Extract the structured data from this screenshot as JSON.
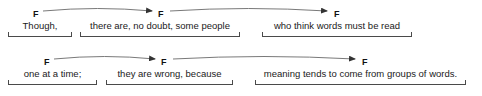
{
  "diagram": {
    "type": "intonation-phrase-annotation",
    "sentence": "Though, there are, no doubt, some people who think words must be read one at a time; they are wrong, because meaning tends to come from groups of words.",
    "tone_mark": "F",
    "rows": [
      {
        "row_index": 0,
        "units": [
          {
            "text": "Though,",
            "tone": "F",
            "tone_x": 33,
            "tone_y": 10,
            "bracket_left": 8,
            "bracket_right": 72,
            "has_incoming_arrow": false
          },
          {
            "text": "there are, no doubt, some people",
            "tone": "F",
            "tone_x": 158,
            "tone_y": 10,
            "bracket_left": 80,
            "bracket_right": 240,
            "has_incoming_arrow": true
          },
          {
            "text": "who think words must be read",
            "tone": "F",
            "tone_x": 334,
            "tone_y": 10,
            "bracket_left": 262,
            "bracket_right": 412,
            "has_incoming_arrow": true
          }
        ],
        "arcs": [
          {
            "from_x": 43,
            "to_x": 152,
            "y": 11,
            "sag": 5
          },
          {
            "from_x": 170,
            "to_x": 327,
            "y": 11,
            "sag": 5
          }
        ]
      },
      {
        "row_index": 1,
        "units": [
          {
            "text": "one at a time;",
            "tone": "F",
            "tone_x": 44,
            "tone_y": 58,
            "bracket_left": 8,
            "bracket_right": 97,
            "has_incoming_arrow": false
          },
          {
            "text": "they are wrong, because",
            "tone": "F",
            "tone_x": 161,
            "tone_y": 58,
            "bracket_left": 106,
            "bracket_right": 233,
            "has_incoming_arrow": true
          },
          {
            "text": "meaning tends to come from groups of words.",
            "tone": "F",
            "tone_x": 362,
            "tone_y": 58,
            "bracket_left": 255,
            "bracket_right": 466,
            "has_incoming_arrow": true
          }
        ],
        "arcs": [
          {
            "from_x": 54,
            "to_x": 155,
            "y": 59,
            "sag": 5
          },
          {
            "from_x": 173,
            "to_x": 355,
            "y": 59,
            "sag": 5
          }
        ]
      }
    ],
    "style": {
      "line_color": "#6a6a6a",
      "bracket_color": "#4a4a4a",
      "text_color": "#1a1a1a",
      "background": "#ffffff"
    }
  }
}
